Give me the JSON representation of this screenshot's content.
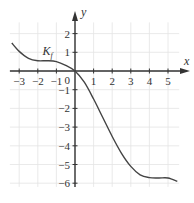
{
  "chart_data": {
    "type": "line",
    "title": "",
    "xlabel": "x",
    "ylabel": "y",
    "xlim": [
      -3.5,
      5.6
    ],
    "ylim": [
      -6.3,
      2.8
    ],
    "grid": true,
    "x_ticks": [
      -3,
      -2,
      -1,
      1,
      2,
      3,
      4,
      5
    ],
    "y_ticks": [
      2,
      1,
      -1,
      -2,
      -3,
      -4,
      -5,
      -6
    ],
    "origin_label": "0",
    "series": [
      {
        "name": "K_f",
        "x": [
          -3.4,
          -3.0,
          -2.5,
          -2.0,
          -1.5,
          -1.0,
          -0.5,
          0,
          0.5,
          1.0,
          1.5,
          2.0,
          2.5,
          3.0,
          3.5,
          4.0,
          4.5,
          5.0,
          5.5
        ],
        "y": [
          1.5,
          1.05,
          0.68,
          0.55,
          0.55,
          0.5,
          0.3,
          0,
          -0.6,
          -1.5,
          -2.5,
          -3.5,
          -4.4,
          -5.1,
          -5.55,
          -5.7,
          -5.72,
          -5.72,
          -5.9
        ]
      }
    ],
    "annotations": [
      {
        "text": "K_f",
        "x": -1.4,
        "y": 0.9
      }
    ]
  },
  "labels": {
    "x_axis": "x",
    "y_axis": "y",
    "curve": "K",
    "curve_sub": "f",
    "origin": "0"
  }
}
